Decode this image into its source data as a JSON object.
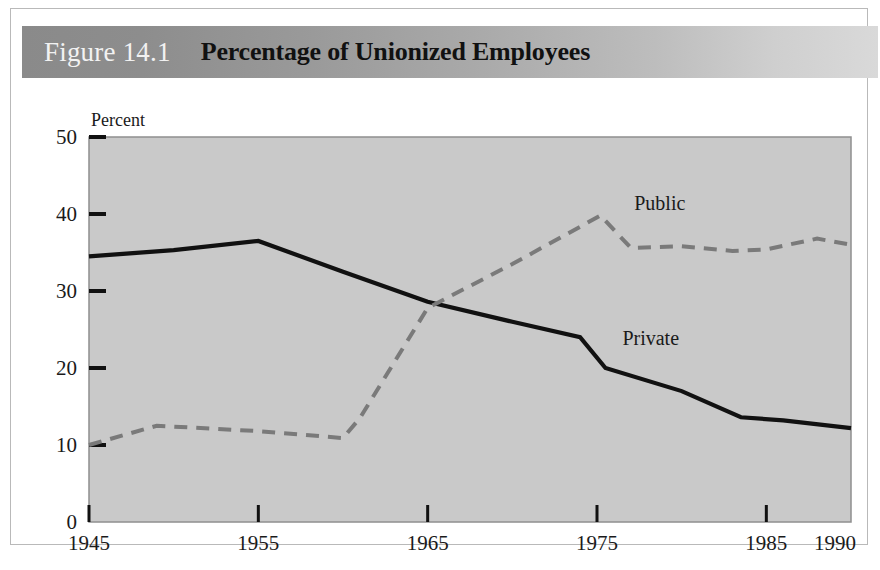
{
  "figure": {
    "number": "Figure 14.1",
    "title": "Percentage of Unionized Employees"
  },
  "colors": {
    "plot_background": "#c9c9c9",
    "private_line": "#111111",
    "public_line": "#7a7a7a",
    "header_dark": "#8a8a8a",
    "header_light": "#d9d9d9",
    "axis": "#3a3a3a",
    "card_border": "#b9b9b9"
  },
  "chart_data": {
    "type": "line",
    "title": "Percentage of Unionized Employees",
    "xlabel": "",
    "ylabel": "Percent",
    "unit_label": "Percent",
    "xlim": [
      1945,
      1990
    ],
    "ylim": [
      0,
      50
    ],
    "grid": false,
    "legend": "inline-annotations",
    "y_ticks": [
      0,
      10,
      20,
      30,
      40,
      50
    ],
    "y_tick_labels": [
      "0",
      "10",
      "20",
      "30",
      "40",
      "50"
    ],
    "x_ticks": [
      1945,
      1955,
      1965,
      1975,
      1985,
      1990
    ],
    "x_tick_labels": [
      "1945",
      "1955",
      "1965",
      "1975",
      "1985",
      "1990"
    ],
    "series": [
      {
        "name": "Private",
        "style": "solid",
        "color": "#111111",
        "label_x": 1976.5,
        "label_y": 23.0,
        "x": [
          1945,
          1950,
          1955,
          1960,
          1965,
          1970,
          1974,
          1975.5,
          1980,
          1983.5,
          1986,
          1990
        ],
        "values": [
          34.5,
          35.3,
          36.5,
          32.5,
          28.6,
          26.0,
          24.0,
          20.0,
          17.0,
          13.6,
          13.2,
          12.2
        ]
      },
      {
        "name": "Public",
        "style": "dashed",
        "color": "#7a7a7a",
        "label_x": 1977.2,
        "label_y": 40.5,
        "x": [
          1945,
          1949,
          1955,
          1960,
          1961,
          1965,
          1970,
          1975.2,
          1977,
          1980,
          1983,
          1985,
          1988,
          1990
        ],
        "values": [
          10.0,
          12.5,
          11.8,
          10.9,
          13.5,
          27.8,
          33.5,
          39.8,
          35.6,
          35.8,
          35.2,
          35.4,
          36.8,
          36.0
        ]
      }
    ]
  }
}
